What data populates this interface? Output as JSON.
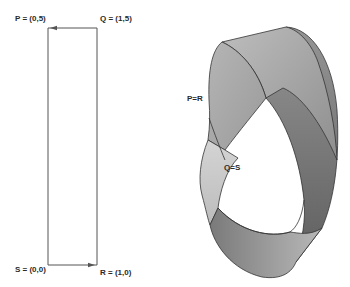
{
  "diagram": {
    "type": "mobius-strip-construction",
    "rectangle": {
      "corners": {
        "P": "P = (0,5)",
        "Q": "Q = (1,5)",
        "S": "S = (0,0)",
        "R": "R = (1,0)"
      },
      "edges": [
        {
          "from": "Q",
          "to": "P",
          "arrow": true,
          "direction": "left"
        },
        {
          "from": "S",
          "to": "R",
          "arrow": true,
          "direction": "right"
        },
        {
          "from": "P",
          "to": "S",
          "arrow": false
        },
        {
          "from": "Q",
          "to": "R",
          "arrow": false
        }
      ],
      "stroke_color": "#555555"
    },
    "mobius_strip": {
      "labels": {
        "pr": "P=R",
        "qs": "Q=S"
      },
      "colors": {
        "light": "#c8c8c8",
        "mid": "#a6a6a6",
        "dark": "#6e6e6e",
        "outline": "#333333"
      }
    }
  }
}
